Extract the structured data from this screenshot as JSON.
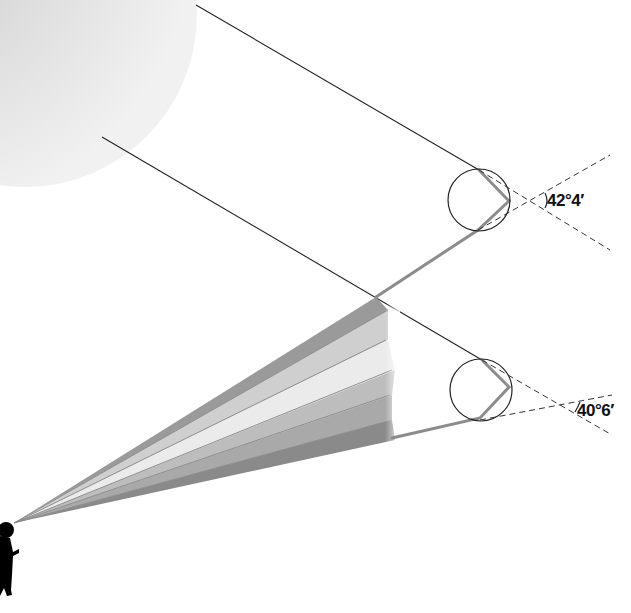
{
  "diagram": {
    "elements": {
      "sun": {
        "label": "sun",
        "color": "#e2e2e2"
      },
      "upper_drop": {
        "label": "raindrop (red ray)",
        "angle_label": "42°4′"
      },
      "lower_drop": {
        "label": "raindrop (violet ray)",
        "angle_label": "40°6′"
      },
      "observer": {
        "label": "observer silhouette",
        "color": "#000000"
      },
      "rainbow_bands": {
        "count": 6,
        "colors": [
          "#9a9a9a",
          "#cfcfcf",
          "#e8e8e8",
          "#b9b9b9",
          "#a8a8a8",
          "#8a8a8a"
        ]
      }
    },
    "colors": {
      "ray_line": "#222222",
      "refracted_ray": "#8c8c8c",
      "dashed_line": "#333333"
    }
  }
}
